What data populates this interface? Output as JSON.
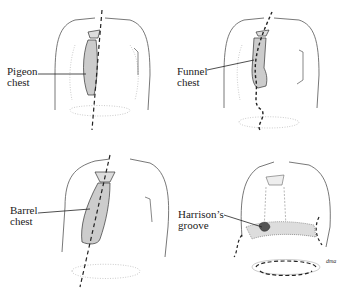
{
  "figure": {
    "panels": [
      {
        "id": "pigeon",
        "label_line1": "Pigeon",
        "label_line2": "chest"
      },
      {
        "id": "funnel",
        "label_line1": "Funnel",
        "label_line2": "chest"
      },
      {
        "id": "barrel",
        "label_line1": "Barrel",
        "label_line2": "chest"
      },
      {
        "id": "harrison",
        "label_line1": "Harrison’s",
        "label_line2": "groove"
      }
    ],
    "signature": "dma"
  },
  "colors": {
    "line": "#333333",
    "light_line": "#aaaaaa",
    "stipple": "#999999",
    "background": "#ffffff"
  }
}
